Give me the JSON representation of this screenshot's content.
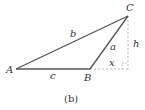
{
  "figure": {
    "caption": "(b)",
    "vertices": {
      "A": {
        "label": "A",
        "x": 16,
        "y": 69
      },
      "B": {
        "label": "B",
        "x": 90,
        "y": 69
      },
      "C": {
        "label": "C",
        "x": 128,
        "y": 16
      }
    },
    "sides": {
      "a": {
        "label": "a",
        "from": "B",
        "to": "C"
      },
      "b": {
        "label": "b",
        "from": "A",
        "to": "C"
      },
      "c": {
        "label": "c",
        "from": "A",
        "to": "B"
      }
    },
    "construction": {
      "height_label": "h",
      "extension_label": "x",
      "foot": {
        "x": 128,
        "y": 69
      },
      "right_angle_marker": true
    },
    "colors": {
      "triangle": "#555555",
      "dashed": "#aaaaaa",
      "text": "#333333"
    }
  }
}
